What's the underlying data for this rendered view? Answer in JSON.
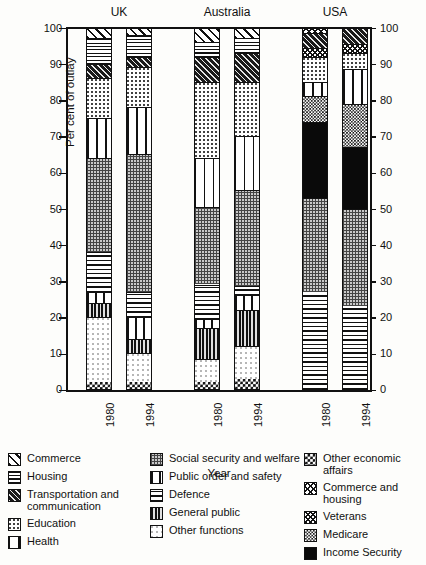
{
  "chart_data": {
    "type": "bar",
    "subtype": "stacked-100",
    "title": "",
    "xlabel": "Year",
    "ylabel": "Per cent of outlay",
    "ylim": [
      0,
      100
    ],
    "yticks": [
      0,
      10,
      20,
      30,
      40,
      50,
      60,
      70,
      80,
      90,
      100
    ],
    "ytick_labels": [
      "0",
      "10",
      "20",
      "30",
      "40",
      "50",
      "60",
      "70",
      "80",
      "90",
      "100"
    ],
    "grid": false,
    "legend_position": "below",
    "groups": [
      "UK",
      "Australia",
      "USA"
    ],
    "categories": [
      "1980",
      "1994",
      "1980",
      "1994",
      "1980",
      "1994"
    ],
    "group_of_category": [
      "UK",
      "UK",
      "Australia",
      "Australia",
      "USA",
      "USA"
    ],
    "series": [
      {
        "name": "Other economic affairs",
        "pattern": "p-otherecon",
        "values": [
          2,
          2,
          2,
          3,
          0,
          0
        ]
      },
      {
        "name": "Other functions",
        "pattern": "p-otherfunc",
        "values": [
          18,
          8,
          6.5,
          9,
          0,
          0
        ]
      },
      {
        "name": "General public",
        "pattern": "p-genpublic",
        "values": [
          4,
          4,
          8.5,
          10,
          0,
          0
        ]
      },
      {
        "name": "Public order and safety",
        "pattern": "p-publicorder",
        "values": [
          3,
          6,
          2.5,
          4,
          0,
          0
        ]
      },
      {
        "name": "Defence",
        "pattern": "p-defence",
        "values": [
          11,
          7,
          9.5,
          2.5,
          27,
          23
        ]
      },
      {
        "name": "Social security and welfare",
        "pattern": "p-socsec",
        "values": [
          26,
          38,
          21.5,
          26.5,
          26,
          27
        ]
      },
      {
        "name": "Income Security",
        "pattern": "p-income",
        "values": [
          0,
          0,
          0,
          0,
          21,
          17
        ]
      },
      {
        "name": "Medicare",
        "pattern": "p-medicare",
        "values": [
          0,
          0,
          0,
          0,
          7,
          12
        ]
      },
      {
        "name": "Health",
        "pattern": "p-health",
        "values": [
          11,
          13,
          13.5,
          15,
          4,
          9.5
        ]
      },
      {
        "name": "Education",
        "pattern": "p-education",
        "values": [
          11,
          11,
          21,
          15,
          7,
          4.5
        ]
      },
      {
        "name": "Veterans",
        "pattern": "p-veterans",
        "values": [
          0,
          0,
          0,
          0,
          2.5,
          2.5
        ]
      },
      {
        "name": "Transportation and communication",
        "pattern": "p-transport",
        "values": [
          4,
          3,
          7,
          8,
          4,
          4.5
        ]
      },
      {
        "name": "Housing",
        "pattern": "p-housing",
        "values": [
          7,
          6,
          4,
          4,
          0,
          0
        ]
      },
      {
        "name": "Commerce",
        "pattern": "p-commerce",
        "values": [
          3,
          2,
          4,
          3,
          0,
          0
        ]
      },
      {
        "name": "Commerce and housing",
        "pattern": "p-commhous",
        "values": [
          0,
          0,
          0,
          0,
          1.5,
          0
        ]
      }
    ]
  },
  "axes": {
    "ylabel": "Per cent of outlay",
    "xlabel": "Year",
    "ytick_labels": [
      "0",
      "10",
      "20",
      "30",
      "40",
      "50",
      "60",
      "70",
      "80",
      "90",
      "100"
    ],
    "group_labels": [
      "UK",
      "Australia",
      "USA"
    ],
    "year_labels": [
      "1980",
      "1994",
      "1980",
      "1994",
      "1980",
      "1994"
    ]
  },
  "legend": {
    "columns": [
      {
        "items": [
          {
            "label": "Commerce",
            "pattern": "p-commerce",
            "icon": "hatch-diagonal-swatch"
          },
          {
            "label": "Housing",
            "pattern": "p-housing",
            "icon": "grid-fine-swatch"
          },
          {
            "label": "Transportation and communication",
            "pattern": "p-transport",
            "icon": "dark-diagonal-swatch"
          },
          {
            "label": "Education",
            "pattern": "p-education",
            "icon": "dotted-swatch"
          },
          {
            "label": "Health",
            "pattern": "p-health",
            "icon": "vertical-bars-swatch"
          }
        ]
      },
      {
        "items": [
          {
            "label": "Social security and welfare",
            "pattern": "p-socsec",
            "icon": "grey-grid-swatch"
          },
          {
            "label": "Public order and safety",
            "pattern": "p-publicorder",
            "icon": "window-pane-swatch"
          },
          {
            "label": "Defence",
            "pattern": "p-defence",
            "icon": "horizontal-lines-swatch"
          },
          {
            "label": "General public",
            "pattern": "p-genpublic",
            "icon": "thick-vertical-swatch"
          },
          {
            "label": "Other functions",
            "pattern": "p-otherfunc",
            "icon": "sparse-dot-swatch"
          }
        ]
      },
      {
        "items": [
          {
            "label": "Other economic affairs",
            "pattern": "p-otherecon",
            "icon": "checkerboard-swatch"
          },
          {
            "label": "Commerce and housing",
            "pattern": "p-commhous",
            "icon": "cross-hatch-swatch"
          },
          {
            "label": "Veterans",
            "pattern": "p-veterans",
            "icon": "dense-crosshatch-swatch"
          },
          {
            "label": "Medicare",
            "pattern": "p-medicare",
            "icon": "fine-checker-swatch"
          },
          {
            "label": "Income Security",
            "pattern": "p-income",
            "icon": "solid-black-swatch"
          }
        ]
      }
    ]
  }
}
